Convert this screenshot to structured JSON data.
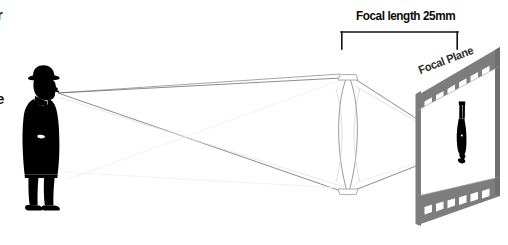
{
  "diagram": {
    "background_color": "#ffffff",
    "width": 508,
    "height": 245
  },
  "annotations": {
    "focal_length_label": "Focal length 25mm",
    "focal_plane_label": "Focal Plane",
    "clipped_text_top": "r",
    "clipped_text_left": "e"
  },
  "elements": {
    "subject_name": "man-silhouette",
    "lens_name": "convex-lens",
    "film_name": "film-strip",
    "image_name": "inverted-image",
    "bracket_name": "focal-length-bracket"
  },
  "colors": {
    "silhouette": "#000000",
    "film_gray": "#808080",
    "film_gray_dark": "#6e6e6e",
    "lens_outline": "#8a8a8a",
    "ray_dark": "#555555",
    "ray_light": "#d8d8d8",
    "bracket": "#111111",
    "text": "#0a0a0a",
    "background": "#ffffff"
  },
  "geometry": {
    "subject_point_x": 58,
    "subject_point_y": 93,
    "lens_center_x": 348,
    "lens_top_y": 74,
    "lens_bottom_y": 195,
    "focus_x": 462,
    "focus_y": 148,
    "bracket_left_x": 341,
    "bracket_right_x": 458,
    "bracket_y": 32
  }
}
